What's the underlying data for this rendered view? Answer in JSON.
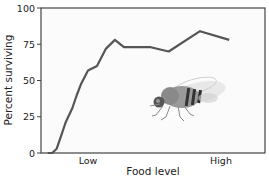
{
  "chart_data": {
    "type": "line",
    "title": "",
    "xlabel": "Food level",
    "ylabel": "Percent surviving",
    "ylim": [
      0,
      100
    ],
    "yticks": [
      0,
      25,
      50,
      75,
      100
    ],
    "xtick_labels": [
      "Low",
      "High"
    ],
    "grid": false,
    "legend": null,
    "annotations": [
      "fruit fly illustration inside plot area"
    ],
    "series": [
      {
        "name": "survival",
        "color": "#555555",
        "x": [
          0.03,
          0.05,
          0.07,
          0.09,
          0.11,
          0.14,
          0.16,
          0.18,
          0.21,
          0.25,
          0.29,
          0.33,
          0.37,
          0.49,
          0.57,
          0.71,
          0.84
        ],
        "values": [
          0,
          0,
          3,
          12,
          21,
          31,
          40,
          48,
          57,
          60,
          72,
          78,
          73,
          73,
          70,
          84,
          78
        ]
      }
    ]
  },
  "labels": {
    "y100": "100",
    "y75": "75",
    "y50": "50",
    "y25": "25",
    "y0": "0",
    "x_low": "Low",
    "x_high": "High",
    "xlabel": "Food level",
    "ylabel": "Percent surviving"
  }
}
